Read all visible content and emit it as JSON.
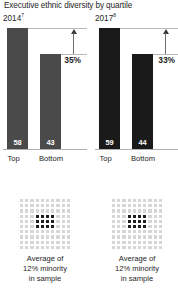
{
  "chart_data": {
    "type": "bar",
    "title": "Executive ethnic diversity by quartile",
    "xlabel": "",
    "ylabel": "",
    "ylim": [
      0,
      70
    ],
    "grid": false,
    "legend": "none",
    "categories": [
      "Top",
      "Bottom"
    ],
    "panels": [
      {
        "name": "2014",
        "year_label": "2014",
        "footnote_marker": "7",
        "categories": [
          "Top",
          "Bottom"
        ],
        "values": [
          58,
          43
        ],
        "bar_color": "#4a4a4a",
        "gap_label": "35%",
        "gap_value": 35,
        "annotation": "Average of 12% minority in sample",
        "dot_grid": {
          "rows": 10,
          "columns": 10,
          "total": 100,
          "highlighted": 12,
          "highlight_color": "#1f1f1f",
          "base_color": "#d6d6d6"
        }
      },
      {
        "name": "2017",
        "year_label": "2017",
        "footnote_marker": "8",
        "categories": [
          "Top",
          "Bottom"
        ],
        "values": [
          59,
          44
        ],
        "bar_color": "#1a1a1a",
        "gap_label": "33%",
        "gap_value": 33,
        "annotation": "Average of 12% minority in sample",
        "dot_grid": {
          "rows": 10,
          "columns": 10,
          "total": 100,
          "highlighted": 12,
          "highlight_color": "#1f1f1f",
          "base_color": "#d6d6d6"
        }
      }
    ]
  },
  "title": "Executive ethnic diversity by quartile",
  "panel_left": {
    "year": "2014",
    "footnote": "7",
    "bar_top_value": "58",
    "bar_bottom_value": "43",
    "gap_label": "35%",
    "cat_top": "Top",
    "cat_bottom": "Bottom",
    "caption_line1": "Average of",
    "caption_line2": "12% minority",
    "caption_line3": "in sample"
  },
  "panel_right": {
    "year": "2017",
    "footnote": "8",
    "bar_top_value": "59",
    "bar_bottom_value": "44",
    "gap_label": "33%",
    "cat_top": "Top",
    "cat_bottom": "Bottom",
    "caption_line1": "Average of",
    "caption_line2": "12% minority",
    "caption_line3": "in sample"
  }
}
